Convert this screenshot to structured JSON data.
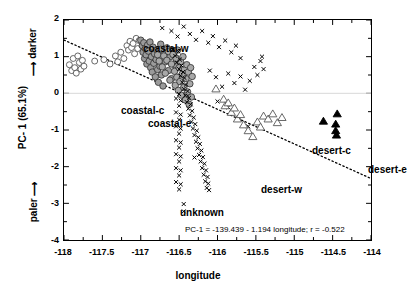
{
  "figure": {
    "width": 396,
    "height": 292,
    "background": "#ffffff"
  },
  "axes": {
    "x_title": "longitude",
    "y_title": "PC- 1 (65.1%)",
    "y_top_label": "darker",
    "y_bottom_label": "paler",
    "x_ticks": [
      "-118",
      "-117.5",
      "-117",
      "-116.5",
      "-116",
      "-115.5",
      "-115",
      "-114.5",
      "-114"
    ],
    "y_ticks": [
      "2",
      "1",
      "0",
      "-1",
      "-2",
      "-3",
      "-4"
    ]
  },
  "annotation": {
    "equation": "PC-1 = -139.439 - 1.194 longitude; r = -0.522"
  },
  "group_labels": [
    {
      "name": "coastal-w",
      "text": "coastal-w",
      "x": 80,
      "y": 24
    },
    {
      "name": "coastal-c",
      "text": "coastal-c",
      "x": 58,
      "y": 86
    },
    {
      "name": "coastal-e",
      "text": "coastal-e",
      "x": 85,
      "y": 99
    },
    {
      "name": "unknown",
      "text": "unknown",
      "x": 117,
      "y": 188
    },
    {
      "name": "desert-w",
      "text": "desert-w",
      "x": 198,
      "y": 165
    },
    {
      "name": "desert-c",
      "text": "desert-c",
      "x": 249,
      "y": 126
    },
    {
      "name": "desert-e",
      "text": "desert-e",
      "x": 305,
      "y": 145
    }
  ],
  "chart_data": {
    "type": "scatter",
    "title": "",
    "xlabel": "longitude",
    "ylabel": "PC- 1 (65.1%)",
    "xlim": [
      -118,
      -114
    ],
    "ylim": [
      -4,
      2
    ],
    "grid": false,
    "legend": "none (in-plot text labels)",
    "regression": {
      "equation": "PC-1 = -139.439 - 1.194 longitude; r = -0.522",
      "intercept": -139.439,
      "slope": -1.194,
      "r": -0.522,
      "style": "dotted",
      "x_from": -118.0,
      "x_to": -114.0,
      "y_from": 1.453,
      "y_to": -2.323
    },
    "series": [
      {
        "name": "coastal-w",
        "marker": "open-circle",
        "fill": "#ffffff",
        "stroke": "#555555",
        "size": 6,
        "points": [
          [
            -117.93,
            0.78
          ],
          [
            -117.9,
            0.62
          ],
          [
            -117.88,
            0.95
          ],
          [
            -117.86,
            0.7
          ],
          [
            -117.84,
            0.55
          ],
          [
            -117.82,
            1.02
          ],
          [
            -117.8,
            0.84
          ],
          [
            -117.78,
            0.66
          ],
          [
            -117.76,
            0.9
          ],
          [
            -117.74,
            0.74
          ],
          [
            -117.6,
            0.88
          ],
          [
            -117.48,
            0.92
          ],
          [
            -117.4,
            0.8
          ],
          [
            -117.33,
            1.02
          ],
          [
            -117.3,
            0.86
          ],
          [
            -117.26,
            1.12
          ],
          [
            -117.22,
            0.95
          ],
          [
            -117.18,
            1.3
          ],
          [
            -117.16,
            1.18
          ],
          [
            -117.14,
            1.42
          ],
          [
            -117.12,
            1.25
          ],
          [
            -117.1,
            1.36
          ],
          [
            -117.08,
            1.08
          ],
          [
            -117.06,
            1.5
          ],
          [
            -117.04,
            1.22
          ],
          [
            -117.02,
            1.44
          ]
        ]
      },
      {
        "name": "coastal-c",
        "marker": "filled-circle",
        "fill": "#9b9b9b",
        "stroke": "#3a3a3a",
        "size": 6.5,
        "points": [
          [
            -117.0,
            1.45
          ],
          [
            -116.98,
            1.3
          ],
          [
            -116.97,
            1.12
          ],
          [
            -116.96,
            1.38
          ],
          [
            -116.95,
            0.95
          ],
          [
            -116.94,
            1.22
          ],
          [
            -116.93,
            1.05
          ],
          [
            -116.92,
            0.8
          ],
          [
            -116.91,
            1.32
          ],
          [
            -116.9,
            1.15
          ],
          [
            -116.89,
            0.88
          ],
          [
            -116.88,
            1.4
          ],
          [
            -116.87,
            0.7
          ],
          [
            -116.86,
            1.0
          ],
          [
            -116.85,
            0.58
          ],
          [
            -116.84,
            1.26
          ],
          [
            -116.83,
            0.82
          ],
          [
            -116.82,
            1.08
          ],
          [
            -116.81,
            0.45
          ],
          [
            -116.8,
            0.92
          ],
          [
            -116.79,
            1.18
          ],
          [
            -116.78,
            0.65
          ],
          [
            -116.77,
            0.3
          ],
          [
            -116.76,
            1.02
          ],
          [
            -116.75,
            0.74
          ],
          [
            -116.74,
            1.34
          ],
          [
            -116.73,
            0.5
          ],
          [
            -116.72,
            0.98
          ],
          [
            -116.71,
            0.2
          ],
          [
            -116.7,
            1.1
          ],
          [
            -116.68,
            0.86
          ],
          [
            -116.66,
            1.24
          ],
          [
            -116.64,
            0.62
          ],
          [
            -116.62,
            1.0
          ],
          [
            -116.6,
            0.4
          ],
          [
            -116.58,
            1.16
          ],
          [
            -116.56,
            0.78
          ],
          [
            -116.54,
            0.96
          ]
        ]
      },
      {
        "name": "coastal-e",
        "marker": "filled-circle",
        "fill": "#a8a8a8",
        "stroke": "#3a3a3a",
        "size": 6.5,
        "points": [
          [
            -116.78,
            1.05
          ],
          [
            -116.76,
            0.88
          ],
          [
            -116.74,
            1.2
          ],
          [
            -116.72,
            0.72
          ],
          [
            -116.7,
            1.02
          ],
          [
            -116.68,
            0.55
          ],
          [
            -116.66,
            0.9
          ],
          [
            -116.64,
            1.14
          ],
          [
            -116.62,
            0.36
          ],
          [
            -116.6,
            0.8
          ],
          [
            -116.58,
            1.06
          ],
          [
            -116.56,
            0.6
          ],
          [
            -116.55,
            0.22
          ],
          [
            -116.54,
            0.95
          ],
          [
            -116.53,
            0.44
          ],
          [
            -116.52,
            1.18
          ],
          [
            -116.51,
            0.08
          ],
          [
            -116.5,
            0.7
          ],
          [
            -116.49,
            0.32
          ],
          [
            -116.48,
            0.86
          ],
          [
            -116.47,
            -0.05
          ],
          [
            -116.46,
            0.52
          ],
          [
            -116.45,
            1.0
          ],
          [
            -116.44,
            0.16
          ],
          [
            -116.43,
            0.66
          ],
          [
            -116.42,
            -0.18
          ],
          [
            -116.41,
            0.4
          ],
          [
            -116.4,
            0.78
          ],
          [
            -116.39,
            0.04
          ],
          [
            -116.38,
            0.58
          ],
          [
            -116.37,
            -0.3
          ],
          [
            -116.36,
            0.26
          ],
          [
            -116.35,
            0.7
          ],
          [
            -116.34,
            -0.1
          ],
          [
            -116.33,
            0.46
          ]
        ]
      },
      {
        "name": "unknown",
        "marker": "x",
        "stroke": "#000000",
        "size": 4,
        "points": [
          [
            -116.72,
            1.78
          ],
          [
            -116.6,
            1.7
          ],
          [
            -116.52,
            1.55
          ],
          [
            -116.44,
            1.82
          ],
          [
            -116.36,
            1.62
          ],
          [
            -116.28,
            1.46
          ],
          [
            -116.2,
            1.7
          ],
          [
            -116.12,
            1.38
          ],
          [
            -116.06,
            1.56
          ],
          [
            -115.98,
            1.26
          ],
          [
            -115.9,
            1.44
          ],
          [
            -115.82,
            1.12
          ],
          [
            -115.76,
            1.3
          ],
          [
            -115.7,
            0.96
          ],
          [
            -116.58,
            1.2
          ],
          [
            -116.55,
            1.02
          ],
          [
            -116.53,
            0.84
          ],
          [
            -116.51,
            1.14
          ],
          [
            -116.5,
            0.66
          ],
          [
            -116.49,
            0.92
          ],
          [
            -116.48,
            0.48
          ],
          [
            -116.47,
            0.76
          ],
          [
            -116.46,
            0.3
          ],
          [
            -116.45,
            0.58
          ],
          [
            -116.44,
            0.12
          ],
          [
            -116.43,
            0.42
          ],
          [
            -116.42,
            -0.06
          ],
          [
            -116.41,
            0.24
          ],
          [
            -116.4,
            -0.24
          ],
          [
            -116.39,
            0.06
          ],
          [
            -116.38,
            -0.42
          ],
          [
            -116.37,
            -0.12
          ],
          [
            -116.36,
            -0.6
          ],
          [
            -116.35,
            -0.3
          ],
          [
            -116.34,
            -0.78
          ],
          [
            -116.33,
            -0.48
          ],
          [
            -116.32,
            -0.96
          ],
          [
            -116.31,
            -0.66
          ],
          [
            -116.3,
            -1.14
          ],
          [
            -116.29,
            -0.84
          ],
          [
            -116.28,
            -1.32
          ],
          [
            -116.27,
            -1.02
          ],
          [
            -116.26,
            -1.5
          ],
          [
            -116.25,
            -1.2
          ],
          [
            -116.24,
            -1.68
          ],
          [
            -116.23,
            -1.38
          ],
          [
            -116.22,
            -1.86
          ],
          [
            -116.21,
            -1.56
          ],
          [
            -116.2,
            -2.04
          ],
          [
            -116.19,
            -1.74
          ],
          [
            -116.18,
            -2.22
          ],
          [
            -116.17,
            -1.92
          ],
          [
            -116.16,
            -2.4
          ],
          [
            -116.15,
            -2.1
          ],
          [
            -116.14,
            -2.58
          ],
          [
            -116.13,
            -2.28
          ],
          [
            -116.12,
            -2.46
          ],
          [
            -116.11,
            -2.64
          ],
          [
            -116.5,
            -0.02
          ],
          [
            -116.5,
            -0.34
          ],
          [
            -116.5,
            -0.72
          ],
          [
            -116.5,
            -1.1
          ],
          [
            -116.5,
            -1.48
          ],
          [
            -116.5,
            -1.86
          ],
          [
            -116.5,
            -2.24
          ],
          [
            -116.5,
            -2.62
          ],
          [
            -116.48,
            -0.2
          ],
          [
            -116.48,
            -0.58
          ],
          [
            -116.48,
            -0.96
          ],
          [
            -116.48,
            -1.34
          ],
          [
            -116.48,
            -1.72
          ],
          [
            -116.48,
            -2.1
          ],
          [
            -116.48,
            -2.48
          ],
          [
            -116.54,
            -0.14
          ],
          [
            -116.54,
            -0.52
          ],
          [
            -116.54,
            -0.9
          ],
          [
            -116.54,
            -1.28
          ],
          [
            -116.54,
            -1.66
          ],
          [
            -116.54,
            -2.04
          ],
          [
            -116.54,
            -2.42
          ],
          [
            -116.44,
            -3.02
          ],
          [
            -116.44,
            -3.22
          ],
          [
            -116.3,
            -1.75
          ],
          [
            -116.0,
            -0.22
          ],
          [
            -115.86,
            -0.38
          ],
          [
            -115.72,
            -0.66
          ],
          [
            -115.6,
            -0.9
          ],
          [
            -116.1,
            0.62
          ],
          [
            -116.02,
            0.44
          ],
          [
            -115.94,
            0.18
          ],
          [
            -115.86,
            0.54
          ],
          [
            -115.78,
            0.28
          ],
          [
            -115.7,
            0.46
          ],
          [
            -115.64,
            0.1
          ],
          [
            -115.58,
            0.34
          ],
          [
            -115.52,
            0.72
          ],
          [
            -115.48,
            0.5
          ],
          [
            -115.44,
            0.88
          ],
          [
            -115.42,
            1.0
          ],
          [
            -115.4,
            0.66
          ]
        ]
      },
      {
        "name": "desert-w",
        "marker": "open-triangle",
        "fill": "#ffffff",
        "stroke": "#555555",
        "size": 7,
        "points": [
          [
            -116.02,
            0.12
          ],
          [
            -115.92,
            -0.16
          ],
          [
            -115.9,
            -0.34
          ],
          [
            -115.86,
            -0.26
          ],
          [
            -115.82,
            -0.52
          ],
          [
            -115.78,
            -0.4
          ],
          [
            -115.74,
            -0.7
          ],
          [
            -115.7,
            -0.58
          ],
          [
            -115.66,
            -0.86
          ],
          [
            -115.6,
            -1.02
          ],
          [
            -115.54,
            -1.18
          ],
          [
            -115.48,
            -0.78
          ],
          [
            -115.44,
            -0.92
          ],
          [
            -115.4,
            -0.62
          ]
        ]
      },
      {
        "name": "desert-c",
        "marker": "open-triangle",
        "fill": "#ffffff",
        "stroke": "#555555",
        "size": 7,
        "points": [
          [
            -115.34,
            -0.7
          ],
          [
            -115.28,
            -0.56
          ],
          [
            -115.22,
            -0.8
          ],
          [
            -115.16,
            -0.66
          ]
        ]
      },
      {
        "name": "desert-e",
        "marker": "filled-triangle",
        "fill": "#000000",
        "stroke": "#000000",
        "size": 7,
        "points": [
          [
            -114.62,
            -0.76
          ],
          [
            -114.44,
            -0.56
          ],
          [
            -114.46,
            -0.84
          ],
          [
            -114.46,
            -1.02
          ],
          [
            -114.45,
            -1.14
          ]
        ]
      }
    ]
  }
}
